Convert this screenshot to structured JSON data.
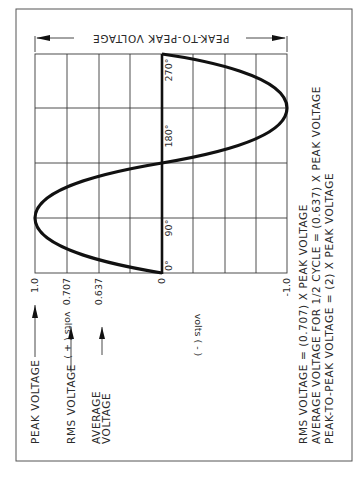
{
  "diagram": {
    "orientation": "rotated 90 degrees counter-clockwise",
    "top_dimension_label": "PEAK-TO-PEAK VOLTAGE",
    "phase_labels": [
      "0°",
      "90°",
      "180°",
      "270°"
    ],
    "voltage_ticks": {
      "peak": "1.0",
      "rms": "0.707",
      "average": "0.637",
      "zero": "0",
      "negative_peak": "-1.0"
    },
    "axis_labels": {
      "positive": "volts ( + )",
      "negative": "volts ( - )"
    },
    "callouts": {
      "peak": "PEAK VOLTAGE",
      "rms": "RMS VOLTAGE",
      "average_line1": "AVERAGE",
      "average_line2": "VOLTAGE"
    },
    "formulas": [
      "RMS VOLTAGE  =  (0.707)  X  PEAK VOLTAGE",
      "AVERAGE VOLTAGE FOR 1/2 CYCLE  =  (0.637)  X  PEAK VOLTAGE",
      "PEAK-TO-PEAK VOLTAGE  =  (2)  X  PEAK VOLTAGE"
    ]
  }
}
